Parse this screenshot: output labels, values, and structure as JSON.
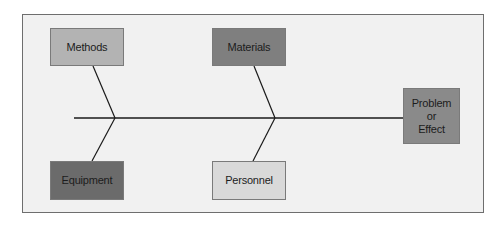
{
  "diagram": {
    "type": "fishbone",
    "effect": {
      "label": "Problem\nor\nEffect",
      "lines": [
        "Problem",
        "or",
        "Effect"
      ],
      "color": "#8a8a8a"
    },
    "causes": [
      {
        "label": "Methods",
        "position": "top-left",
        "color": "#b3b3b3"
      },
      {
        "label": "Materials",
        "position": "top-middle",
        "color": "#7f7f7f"
      },
      {
        "label": "Equipment",
        "position": "bottom-left",
        "color": "#6b6b6b"
      },
      {
        "label": "Personnel",
        "position": "bottom-middle",
        "color": "#d9d9d9"
      }
    ],
    "background": "#f1f1f1",
    "line_color": "#1a1a1a"
  }
}
